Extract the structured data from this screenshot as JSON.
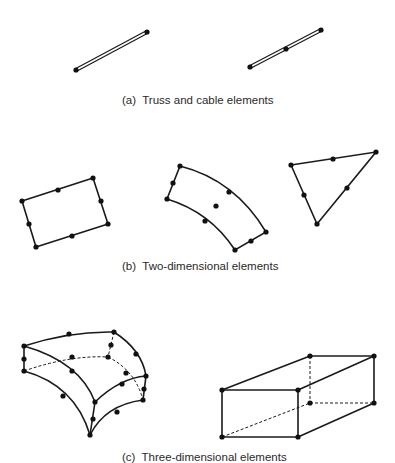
{
  "figure": {
    "panels": [
      {
        "id": "a",
        "caption": "(a)  Truss and cable elements",
        "elements": [
          {
            "name": "two-node truss element",
            "nodes": [
              [
                76,
                70
              ],
              [
                147,
                32
              ]
            ]
          },
          {
            "name": "three-node truss element",
            "nodes": [
              [
                250,
                67
              ],
              [
                286,
                49
              ],
              [
                321,
                30
              ]
            ]
          }
        ]
      },
      {
        "id": "b",
        "caption": "(b)  Two-dimensional elements",
        "elements": [
          {
            "name": "eight-node quadrilateral",
            "nodes": 8
          },
          {
            "name": "nine-node curved quadrilateral",
            "nodes": 9
          },
          {
            "name": "six-node triangle",
            "nodes": 6
          }
        ]
      },
      {
        "id": "c",
        "caption": "(c)  Three-dimensional elements",
        "elements": [
          {
            "name": "twenty-node curved brick",
            "nodes": 20
          },
          {
            "name": "eight-node brick",
            "nodes": 8
          }
        ]
      }
    ],
    "colors": {
      "line": "#1a1a1a",
      "node": "#111111",
      "text": "#2a2a2a",
      "background": "#ffffff"
    }
  }
}
